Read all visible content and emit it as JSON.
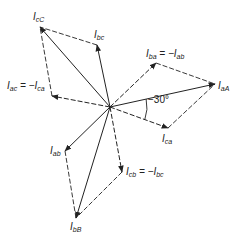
{
  "diagram": {
    "title": "",
    "origin": [
      110,
      107
    ],
    "colors": {
      "stroke": "#222222",
      "background": "#ffffff"
    },
    "phasors": [
      {
        "id": "IaA",
        "tip": [
          215,
          84
        ],
        "style": "solid",
        "label_main": "I",
        "label_sub": "aA",
        "label_pos": [
          218,
          81
        ]
      },
      {
        "id": "IbB",
        "tip": [
          76,
          218
        ],
        "style": "solid",
        "label_main": "I",
        "label_sub": "bB",
        "label_pos": [
          70,
          222
        ]
      },
      {
        "id": "IcC",
        "tip": [
          40,
          27
        ],
        "style": "solid",
        "label_main": "I",
        "label_sub": "cC",
        "label_pos": [
          33,
          12
        ]
      },
      {
        "id": "Iba",
        "tip": [
          156,
          63
        ],
        "style": "dashed",
        "label_main": "I",
        "label_sub": "ba",
        "label_rest": " = −I",
        "label_rest_sub": "ab",
        "label_pos": [
          146,
          49
        ]
      },
      {
        "id": "Ica",
        "tip": [
          168,
          128
        ],
        "style": "dashed",
        "label_main": "I",
        "label_sub": "ca",
        "label_pos": [
          162,
          134
        ]
      },
      {
        "id": "Ibc",
        "tip": [
          97,
          45
        ],
        "style": "solid",
        "label_main": "I",
        "label_sub": "bc",
        "label_pos": [
          94,
          30
        ]
      },
      {
        "id": "Iac",
        "tip": [
          52,
          96
        ],
        "style": "dashed",
        "label_main": "I",
        "label_sub": "ac",
        "label_rest": " = −I",
        "label_rest_sub": "ca",
        "label_pos": [
          7,
          81
        ]
      },
      {
        "id": "Iab",
        "tip": [
          65,
          151
        ],
        "style": "solid",
        "label_main": "I",
        "label_sub": "ab",
        "label_pos": [
          50,
          146
        ]
      },
      {
        "id": "Icb",
        "tip": [
          122,
          172
        ],
        "style": "dashed",
        "label_main": "I",
        "label_sub": "cb",
        "label_rest": " = −I",
        "label_rest_sub": "bc",
        "label_pos": [
          126,
          167
        ]
      }
    ],
    "construction_lines": [
      {
        "from": [
          156,
          63
        ],
        "to": [
          215,
          84
        ]
      },
      {
        "from": [
          168,
          128
        ],
        "to": [
          215,
          84
        ]
      },
      {
        "from": [
          97,
          45
        ],
        "to": [
          40,
          27
        ]
      },
      {
        "from": [
          52,
          96
        ],
        "to": [
          40,
          27
        ]
      },
      {
        "from": [
          65,
          151
        ],
        "to": [
          76,
          218
        ]
      },
      {
        "from": [
          122,
          172
        ],
        "to": [
          76,
          218
        ]
      }
    ],
    "angle": {
      "label": "−30°",
      "label_pos": [
        148,
        94
      ]
    }
  }
}
